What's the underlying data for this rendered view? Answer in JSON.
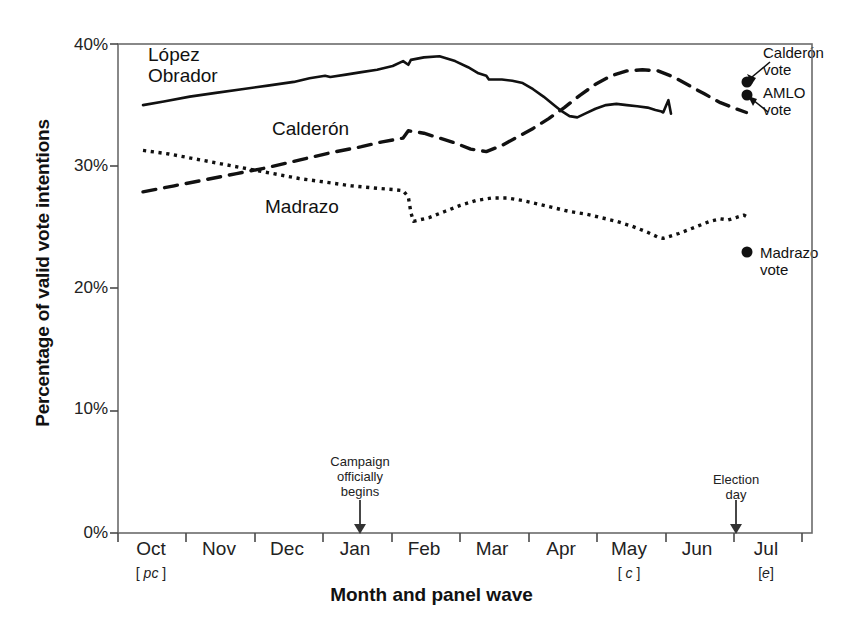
{
  "chart_data": {
    "type": "line",
    "title": "",
    "xlabel": "Month and panel wave",
    "ylabel": "Percentage of valid vote intentions",
    "ylim": [
      0,
      40
    ],
    "yticks": [
      "0%",
      "10%",
      "20%",
      "30%",
      "40%"
    ],
    "ytick_values": [
      0,
      10,
      20,
      30,
      40
    ],
    "grid": false,
    "legend_position": "inline-labels",
    "x": [
      "Oct",
      "Nov",
      "Dec",
      "Jan",
      "Feb",
      "Mar",
      "Apr",
      "May",
      "Jun",
      "Jul"
    ],
    "xticks": [
      "Oct",
      "Nov",
      "Dec",
      "Jan",
      "Feb",
      "Mar",
      "Apr",
      "May",
      "Jun",
      "Jul"
    ],
    "xtick_waves": [
      "[ pc ]",
      "",
      "",
      "",
      "",
      "",
      "",
      "[ c ]",
      "",
      "[e]"
    ],
    "xtick_wave_italics": [
      "pc",
      "",
      "",
      "",
      "",
      "",
      "",
      "c",
      "",
      "e"
    ],
    "series": [
      {
        "name": "López Obrador",
        "style": "solid",
        "color": "#111111",
        "points": [
          [
            0.0,
            35.0
          ],
          [
            0.4,
            35.3
          ],
          [
            0.9,
            35.7
          ],
          [
            1.4,
            36.0
          ],
          [
            1.9,
            36.3
          ],
          [
            2.4,
            36.6
          ],
          [
            2.9,
            36.9
          ],
          [
            3.2,
            37.2
          ],
          [
            3.5,
            37.4
          ],
          [
            3.6,
            37.3
          ],
          [
            3.9,
            37.5
          ],
          [
            4.2,
            37.7
          ],
          [
            4.5,
            37.9
          ],
          [
            4.8,
            38.2
          ],
          [
            5.0,
            38.6
          ],
          [
            5.1,
            38.3
          ],
          [
            5.15,
            38.7
          ],
          [
            5.4,
            38.9
          ],
          [
            5.7,
            39.0
          ],
          [
            6.0,
            38.6
          ],
          [
            6.25,
            38.1
          ],
          [
            6.45,
            37.6
          ],
          [
            6.6,
            37.4
          ],
          [
            6.65,
            37.1
          ],
          [
            6.9,
            37.1
          ],
          [
            7.1,
            37.0
          ],
          [
            7.3,
            36.8
          ],
          [
            7.5,
            36.3
          ],
          [
            7.7,
            35.7
          ],
          [
            7.9,
            35.0
          ],
          [
            8.05,
            34.5
          ],
          [
            8.2,
            34.1
          ],
          [
            8.35,
            34.0
          ],
          [
            8.5,
            34.3
          ],
          [
            8.7,
            34.7
          ],
          [
            8.9,
            35.0
          ],
          [
            9.1,
            35.1
          ],
          [
            9.3,
            35.0
          ],
          [
            9.5,
            34.9
          ],
          [
            9.7,
            34.8
          ],
          [
            9.85,
            34.6
          ],
          [
            9.95,
            34.5
          ],
          [
            10.0,
            34.4
          ],
          [
            10.05,
            34.9
          ],
          [
            10.1,
            35.4
          ],
          [
            10.15,
            34.3
          ]
        ]
      },
      {
        "name": "Calderón",
        "style": "dashed",
        "color": "#111111",
        "points": [
          [
            0.0,
            27.9
          ],
          [
            0.6,
            28.4
          ],
          [
            1.2,
            28.9
          ],
          [
            1.8,
            29.4
          ],
          [
            2.4,
            29.9
          ],
          [
            3.0,
            30.5
          ],
          [
            3.6,
            31.1
          ],
          [
            4.2,
            31.6
          ],
          [
            4.6,
            32.0
          ],
          [
            5.0,
            32.3
          ],
          [
            5.1,
            32.9
          ],
          [
            5.4,
            32.7
          ],
          [
            5.7,
            32.3
          ],
          [
            6.0,
            31.9
          ],
          [
            6.3,
            31.4
          ],
          [
            6.6,
            31.2
          ],
          [
            6.9,
            31.7
          ],
          [
            7.2,
            32.4
          ],
          [
            7.5,
            33.1
          ],
          [
            7.8,
            33.9
          ],
          [
            8.1,
            34.8
          ],
          [
            8.4,
            35.8
          ],
          [
            8.7,
            36.7
          ],
          [
            9.0,
            37.4
          ],
          [
            9.3,
            37.8
          ],
          [
            9.6,
            37.9
          ],
          [
            9.9,
            37.8
          ],
          [
            10.2,
            37.3
          ],
          [
            10.5,
            36.6
          ],
          [
            10.8,
            35.9
          ],
          [
            11.1,
            35.2
          ],
          [
            11.4,
            34.7
          ],
          [
            11.6,
            34.4
          ]
        ]
      },
      {
        "name": "Madrazo",
        "style": "dotted",
        "color": "#111111",
        "points": [
          [
            0.0,
            31.3
          ],
          [
            0.5,
            31.0
          ],
          [
            1.0,
            30.6
          ],
          [
            1.5,
            30.2
          ],
          [
            2.0,
            29.8
          ],
          [
            2.5,
            29.4
          ],
          [
            3.0,
            29.0
          ],
          [
            3.5,
            28.7
          ],
          [
            4.0,
            28.4
          ],
          [
            4.5,
            28.2
          ],
          [
            4.8,
            28.1
          ],
          [
            5.0,
            28.0
          ],
          [
            5.1,
            27.5
          ],
          [
            5.15,
            26.2
          ],
          [
            5.2,
            25.5
          ],
          [
            5.5,
            25.8
          ],
          [
            5.8,
            26.3
          ],
          [
            6.1,
            26.8
          ],
          [
            6.4,
            27.2
          ],
          [
            6.7,
            27.4
          ],
          [
            7.0,
            27.4
          ],
          [
            7.3,
            27.2
          ],
          [
            7.6,
            26.9
          ],
          [
            7.9,
            26.6
          ],
          [
            8.2,
            26.3
          ],
          [
            8.5,
            26.1
          ],
          [
            8.8,
            25.8
          ],
          [
            9.1,
            25.5
          ],
          [
            9.4,
            25.1
          ],
          [
            9.7,
            24.6
          ],
          [
            9.9,
            24.2
          ],
          [
            10.0,
            24.1
          ],
          [
            10.3,
            24.5
          ],
          [
            10.6,
            25.0
          ],
          [
            10.9,
            25.5
          ],
          [
            11.1,
            25.7
          ],
          [
            11.25,
            25.6
          ],
          [
            11.4,
            25.8
          ],
          [
            11.55,
            26.0
          ],
          [
            11.65,
            25.8
          ]
        ]
      }
    ],
    "markers": [
      {
        "name": "Calderón vote",
        "value": 36.6,
        "x_month": "Jul-early"
      },
      {
        "name": "AMLO vote",
        "value": 35.4,
        "x_month": "Jul-early"
      },
      {
        "name": "Madrazo vote",
        "value": 22.8,
        "x_month": "Jul-early"
      }
    ],
    "annotations": [
      {
        "name": "campaign-begins",
        "text_lines": [
          "Campaign",
          "officially",
          "begins"
        ],
        "at_tick": "Jan"
      },
      {
        "name": "election-day",
        "text_lines": [
          "Election",
          "day"
        ],
        "at_tick": "between Jun and Jul"
      }
    ]
  },
  "labels": {
    "series_lopez_line1": "López",
    "series_lopez_line2": "Obrador",
    "series_calderon": "Calderón",
    "series_madrazo": "Madrazo",
    "ylabel": "Percentage of valid vote intentions",
    "xlabel": "Month and panel wave",
    "ytick_0": "0%",
    "ytick_10": "10%",
    "ytick_20": "20%",
    "ytick_30": "30%",
    "ytick_40": "40%",
    "xtick_oct": "Oct",
    "xtick_nov": "Nov",
    "xtick_dec": "Dec",
    "xtick_jan": "Jan",
    "xtick_feb": "Feb",
    "xtick_mar": "Mar",
    "xtick_apr": "Apr",
    "xtick_may": "May",
    "xtick_jun": "Jun",
    "xtick_jul": "Jul",
    "wave_oct": "pc",
    "wave_may": "c",
    "wave_jul": "e",
    "annot_campaign_1": "Campaign",
    "annot_campaign_2": "officially",
    "annot_campaign_3": "begins",
    "annot_election_1": "Election",
    "annot_election_2": "day",
    "vote_calderon_1": "Calderón",
    "vote_calderon_2": "vote",
    "vote_amlo_1": "AMLO",
    "vote_amlo_2": "vote",
    "vote_madrazo_1": "Madrazo",
    "vote_madrazo_2": "vote"
  },
  "colors": {
    "ink": "#111111",
    "frame": "#555555",
    "background": "#ffffff"
  }
}
